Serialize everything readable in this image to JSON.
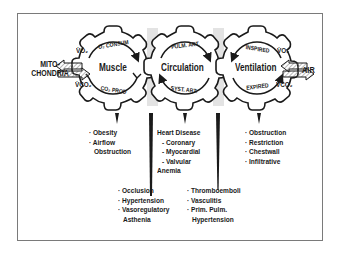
{
  "left_endpoint": {
    "line1": "MITO-",
    "line2": "CHONDRIA"
  },
  "right_endpoint": {
    "label": "AIR"
  },
  "gas_labels": {
    "left_o2": "V̇O₂",
    "left_co2": "V̇CO₂",
    "right_o2": "V̇O₂",
    "right_co2": "V̇CO₂"
  },
  "gears": [
    {
      "name": "Muscle",
      "top_arc": "O₂ CONSUM",
      "bottom_arc": "CO₂ PROD"
    },
    {
      "name": "Circulation",
      "top_arc": "PULM. ART.",
      "bottom_arc": "SYST. ART."
    },
    {
      "name": "Ventilation",
      "top_arc": "INSPIRED",
      "bottom_arc": "EXPIRED"
    }
  ],
  "disorders": {
    "muscle": [
      "· Obesity",
      "· Airflow",
      "Obstruction"
    ],
    "circulation": {
      "heading": "Heart Disease",
      "items": [
        "- Coronary",
        "- Myocardial",
        "- Valvular"
      ],
      "after": "Anemia"
    },
    "ventilation": [
      "· Obstruction",
      "· Restriction",
      "· Chestwall",
      "· Infiltrative"
    ],
    "peripheral_circulation": [
      "· Occlusion",
      "· Hypertension",
      "· Vasoregulatory",
      "Asthenia"
    ],
    "pulmonary_circulation": [
      "· Thromboemboli",
      "· Vasculitis",
      "· Prim. Pulm.",
      "Hypertension"
    ]
  },
  "colors": {
    "ink": "#1a1a1a",
    "shade": "#e3e3e3",
    "frame": "#7a7a7a",
    "hatch": "#9a9a9a"
  }
}
